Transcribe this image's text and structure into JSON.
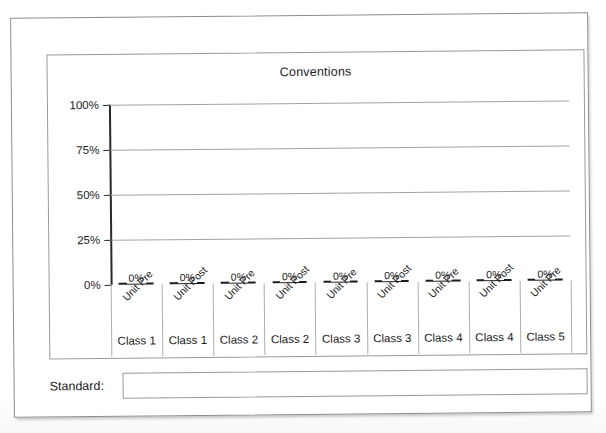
{
  "document": {
    "title": "Conventions"
  },
  "chart_data": {
    "type": "bar",
    "title": "Conventions",
    "xlabel": "",
    "ylabel": "",
    "ylim": [
      0,
      100
    ],
    "grid": true,
    "legend": "none",
    "y_ticks": [
      "0%",
      "25%",
      "50%",
      "75%",
      "100%"
    ],
    "y_tick_values": [
      0,
      25,
      50,
      75,
      100
    ],
    "categories": [
      "Unit Pre",
      "Unit Post",
      "Unit Pre",
      "Unit Post",
      "Unit Pre",
      "Unit Post",
      "Unit Pre",
      "Unit Post",
      "Unit Pre"
    ],
    "group_labels": [
      "Class 1",
      "Class 1",
      "Class 2",
      "Class 2",
      "Class 3",
      "Class 3",
      "Class 4",
      "Class 4",
      "Class 5"
    ],
    "values": [
      0,
      0,
      0,
      0,
      0,
      0,
      0,
      0,
      0
    ],
    "data_labels": [
      "0%",
      "0%",
      "0%",
      "0%",
      "0%",
      "0%",
      "0%",
      "0%",
      "0%"
    ],
    "colors": {
      "bar": "#1d1d1d",
      "gridline": "#a3a3a3",
      "axis": "#2a2a2a",
      "text": "#1b1b1b",
      "frame": "#8d8d8d"
    }
  },
  "standard": {
    "label": "Standard:",
    "value": "",
    "placeholder": ""
  }
}
